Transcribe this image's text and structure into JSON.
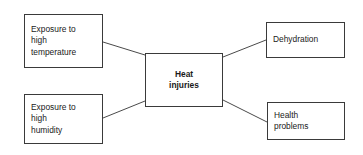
{
  "diagram": {
    "type": "concept-map",
    "background_color": "#ffffff",
    "border_color": "#3a3a3a",
    "text_color": "#1a1a1a",
    "center": {
      "id": "heat-injuries",
      "lines": [
        "Heat",
        "injuries"
      ],
      "bold": true
    },
    "causes": [
      {
        "id": "exposure-temperature",
        "lines": [
          "Exposure to",
          "high",
          "temperature"
        ]
      },
      {
        "id": "exposure-humidity",
        "lines": [
          "Exposure to",
          "high",
          "humidity"
        ]
      }
    ],
    "effects": [
      {
        "id": "dehydration",
        "lines": [
          "Dehydration"
        ]
      },
      {
        "id": "health-problems",
        "lines": [
          "Health",
          "problems"
        ]
      }
    ],
    "connectors": [
      {
        "id": "temperature-to-center",
        "from": "exposure-temperature",
        "to": "heat-injuries",
        "x1": 103,
        "y1": 42,
        "x2": 145,
        "y2": 55
      },
      {
        "id": "humidity-to-center",
        "from": "exposure-humidity",
        "to": "heat-injuries",
        "x1": 103,
        "y1": 118,
        "x2": 145,
        "y2": 101
      },
      {
        "id": "center-to-dehydration",
        "from": "heat-injuries",
        "to": "dehydration",
        "x1": 223,
        "y1": 57,
        "x2": 266,
        "y2": 40
      },
      {
        "id": "center-to-health",
        "from": "heat-injuries",
        "to": "health-problems",
        "x1": 223,
        "y1": 100,
        "x2": 267,
        "y2": 122
      }
    ]
  }
}
